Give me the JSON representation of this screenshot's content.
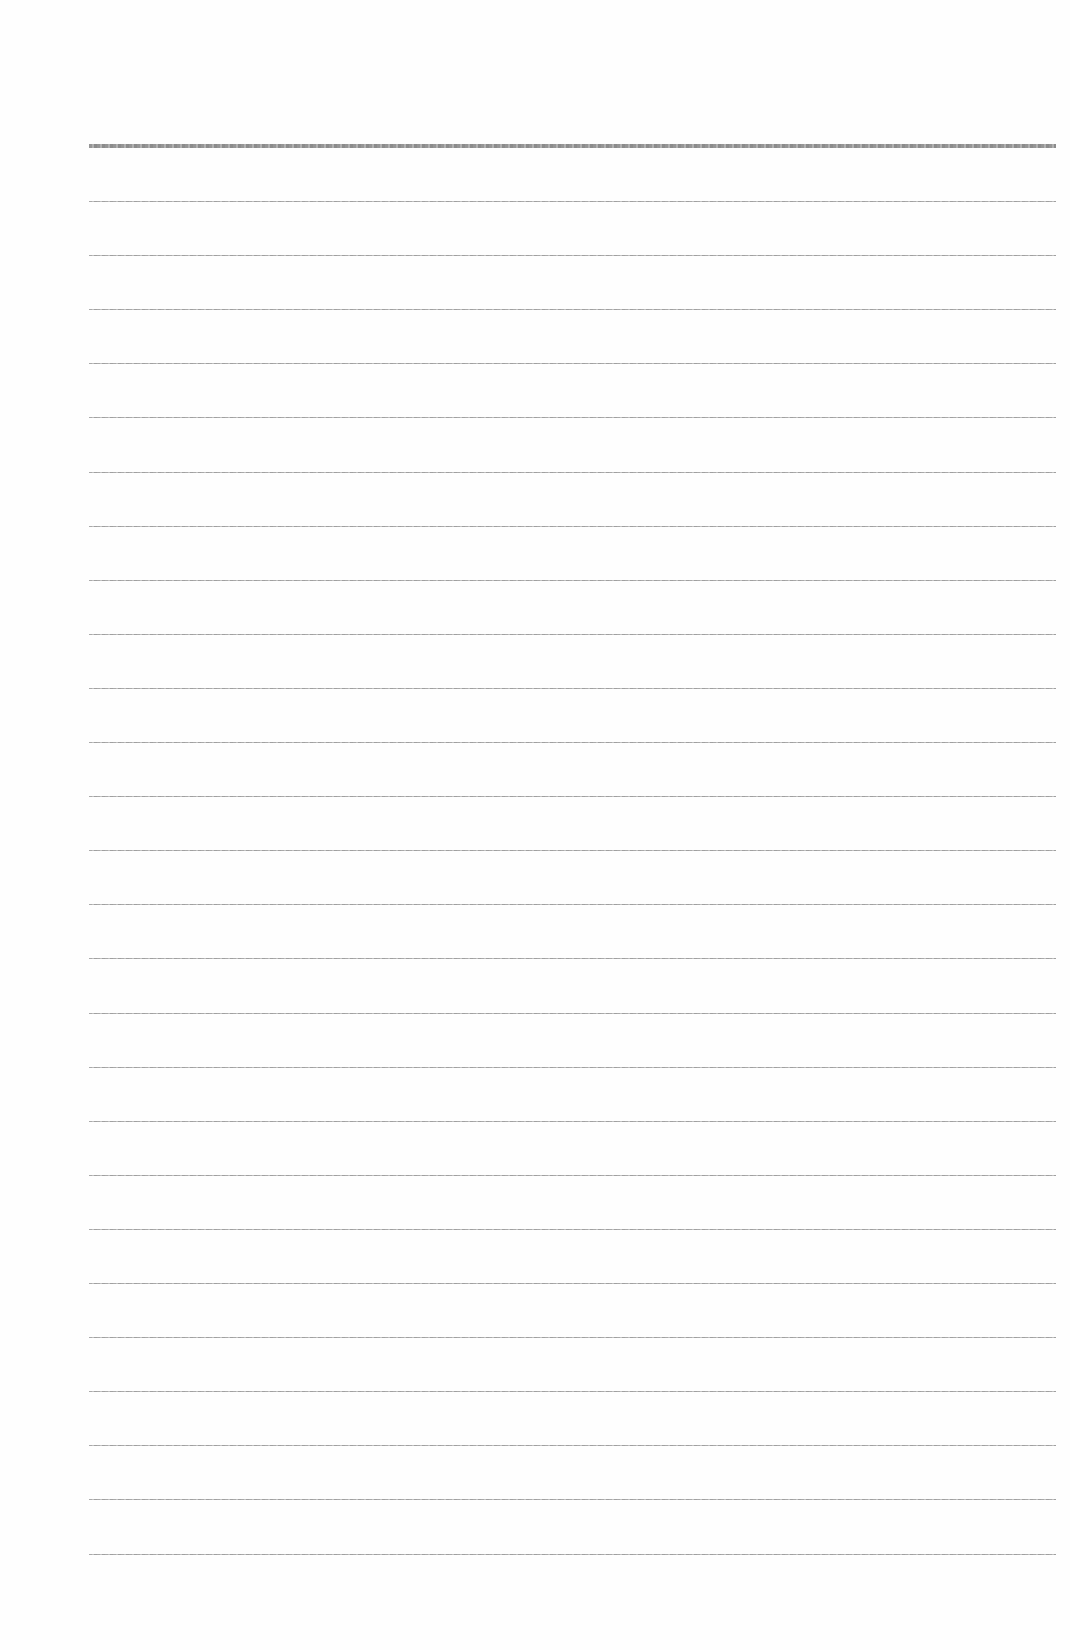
{
  "document": {
    "type": "lined-paper",
    "background_color": "#fefefe",
    "line_color": "#9a9a9a",
    "line_count": 27,
    "header_line": {
      "y": 144,
      "thickness": 4
    },
    "first_body_line_y": 201,
    "line_spacing": 54.1,
    "line_left": 89,
    "line_width": 967,
    "text_content": []
  }
}
